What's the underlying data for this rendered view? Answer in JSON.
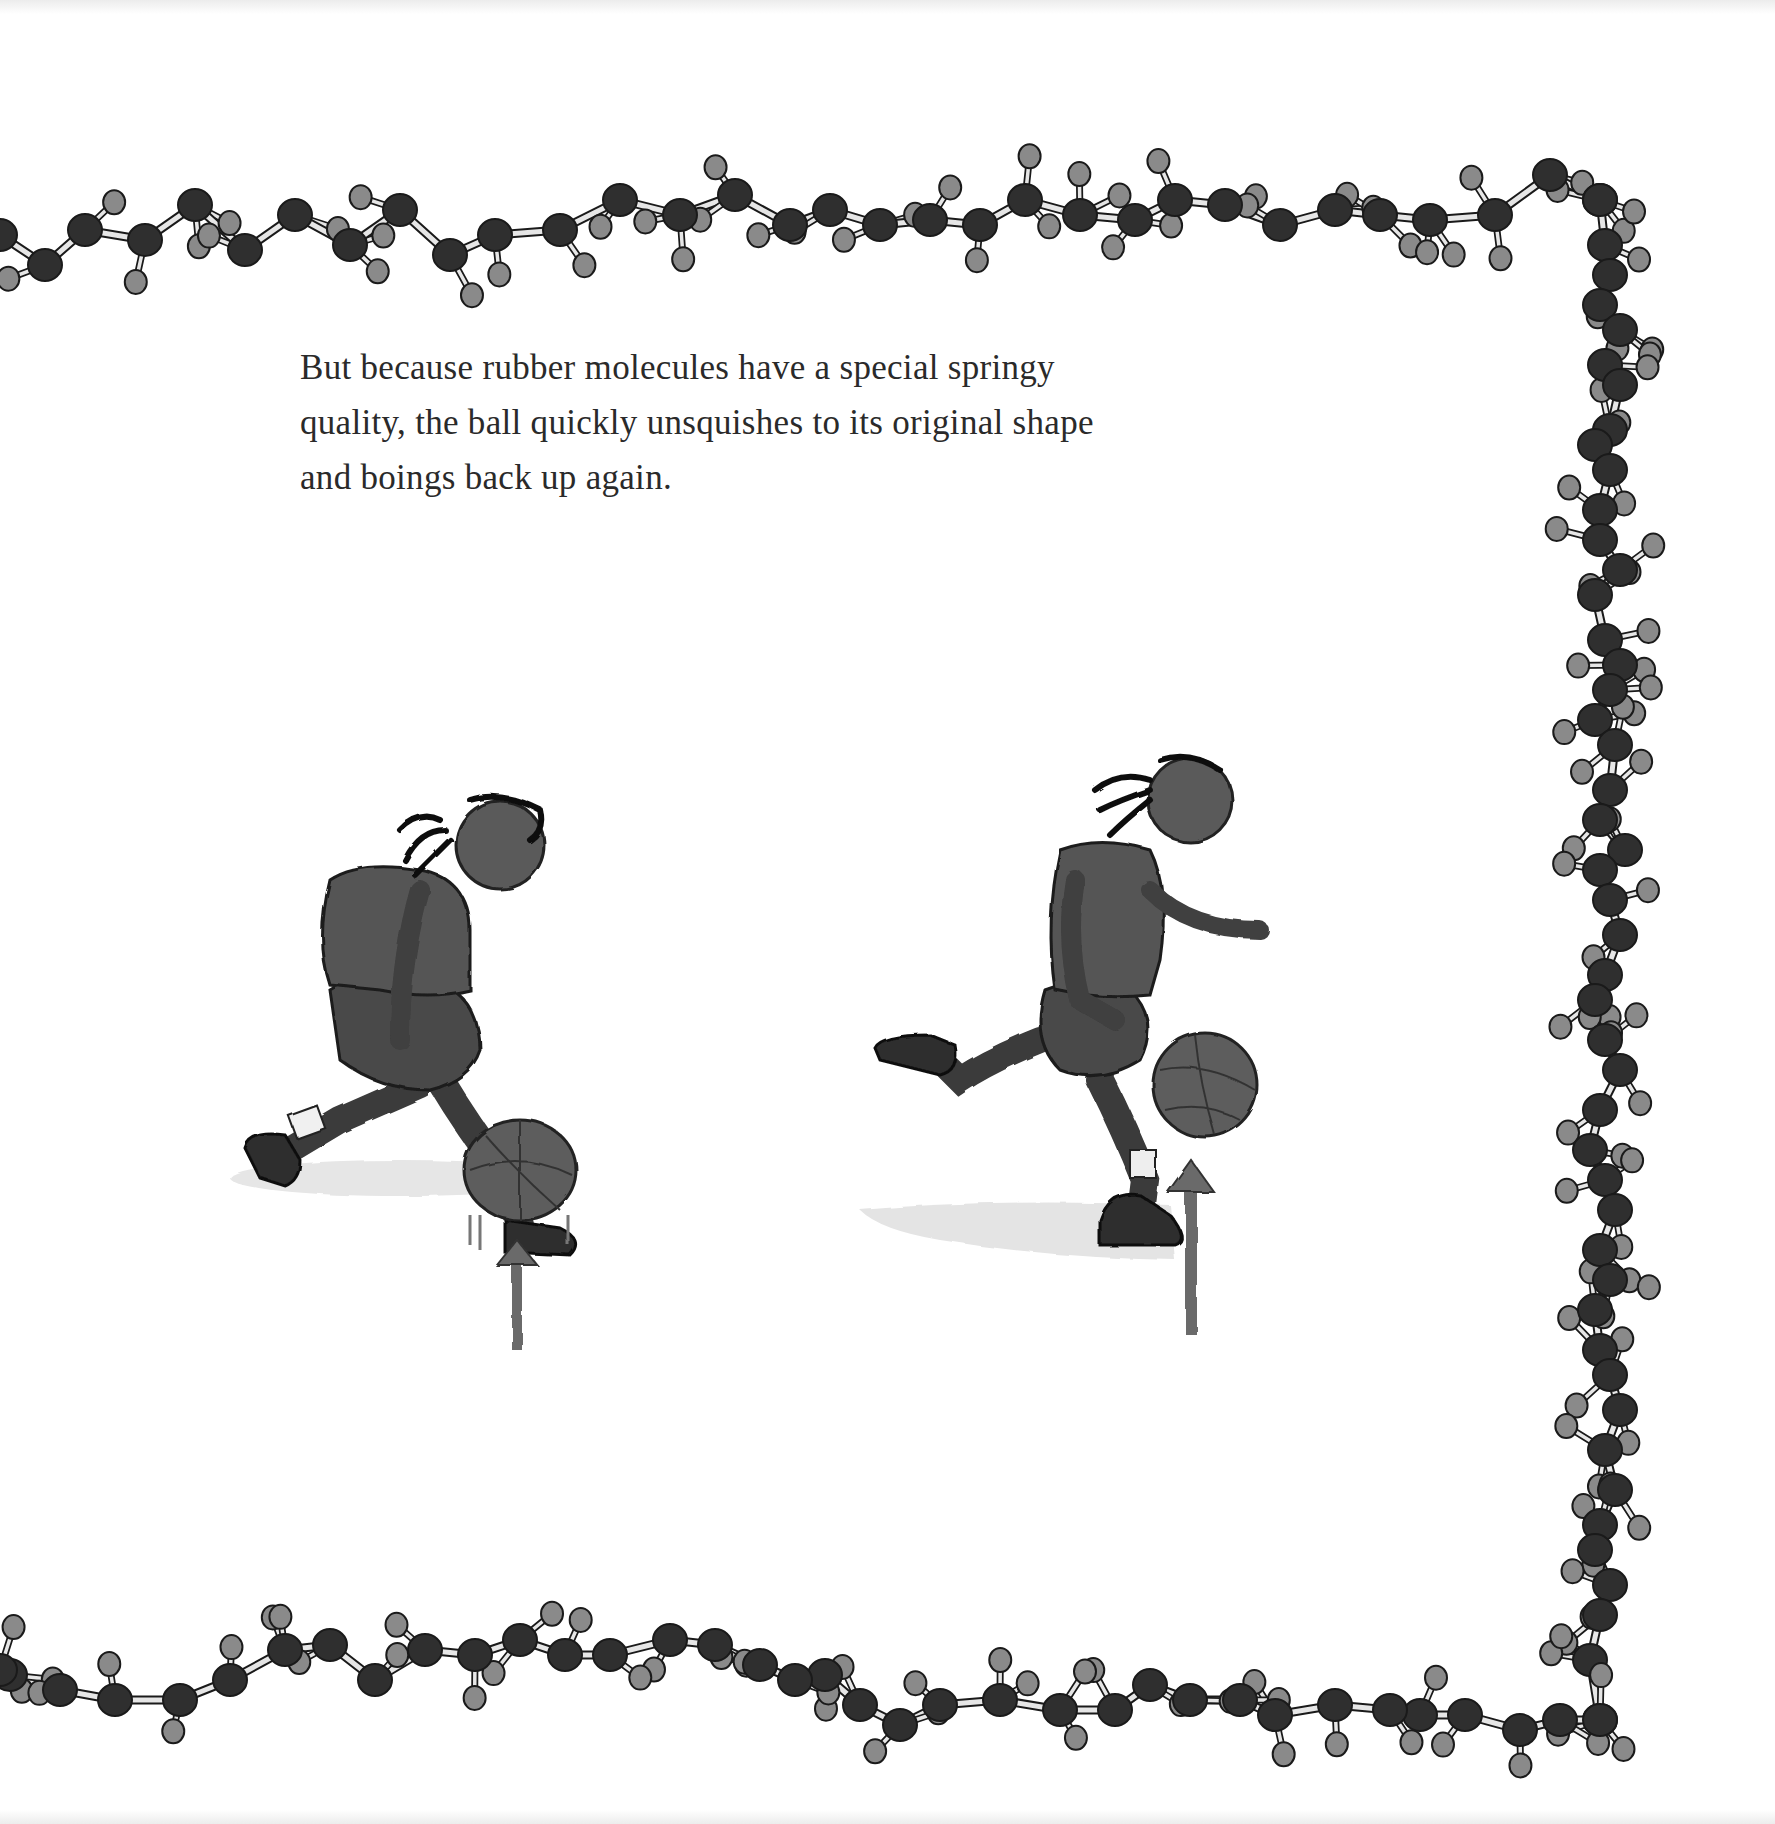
{
  "page": {
    "text_lines": [
      "But because rubber molecules have a special springy",
      "quality, the ball quickly unsquishes to its original shape",
      "and boings back up again."
    ]
  },
  "illustration": {
    "figures": [
      {
        "name": "girl-dribbling-ball-squished",
        "ball_state": "squished against floor",
        "arrow": "up"
      },
      {
        "name": "girl-running-ball-bouncing-up",
        "ball_state": "round, bouncing up",
        "arrow": "up"
      }
    ]
  },
  "border": {
    "description": "rubber (polyisoprene) molecule chain ball-and-stick border",
    "colors": {
      "carbon": "#2f2f2f",
      "hydrogen": "#8a8a8a",
      "bond": "#e6e6e6",
      "outline": "#1a1a1a"
    },
    "top_chain": [
      [
        0,
        235
      ],
      [
        45,
        265
      ],
      [
        85,
        230
      ],
      [
        145,
        240
      ],
      [
        195,
        205
      ],
      [
        245,
        250
      ],
      [
        295,
        215
      ],
      [
        350,
        245
      ],
      [
        400,
        210
      ],
      [
        450,
        255
      ],
      [
        495,
        235
      ],
      [
        560,
        230
      ],
      [
        620,
        200
      ],
      [
        680,
        215
      ],
      [
        735,
        195
      ],
      [
        790,
        225
      ],
      [
        830,
        210
      ],
      [
        880,
        225
      ],
      [
        930,
        220
      ],
      [
        980,
        225
      ],
      [
        1025,
        200
      ],
      [
        1080,
        215
      ],
      [
        1135,
        220
      ],
      [
        1175,
        200
      ],
      [
        1225,
        205
      ],
      [
        1280,
        225
      ],
      [
        1335,
        210
      ],
      [
        1380,
        215
      ],
      [
        1430,
        220
      ],
      [
        1495,
        215
      ],
      [
        1550,
        175
      ],
      [
        1600,
        200
      ]
    ],
    "right_chain": [
      [
        1600,
        200
      ],
      [
        1605,
        245
      ],
      [
        1610,
        275
      ],
      [
        1600,
        305
      ],
      [
        1620,
        330
      ],
      [
        1605,
        365
      ],
      [
        1620,
        385
      ],
      [
        1610,
        430
      ],
      [
        1595,
        445
      ],
      [
        1610,
        470
      ],
      [
        1600,
        510
      ],
      [
        1600,
        540
      ],
      [
        1620,
        570
      ],
      [
        1595,
        595
      ],
      [
        1605,
        640
      ],
      [
        1620,
        665
      ],
      [
        1610,
        690
      ],
      [
        1595,
        720
      ],
      [
        1615,
        745
      ],
      [
        1610,
        790
      ],
      [
        1600,
        820
      ],
      [
        1625,
        850
      ],
      [
        1600,
        870
      ],
      [
        1610,
        900
      ],
      [
        1620,
        935
      ],
      [
        1605,
        975
      ],
      [
        1595,
        1000
      ],
      [
        1605,
        1040
      ],
      [
        1620,
        1070
      ],
      [
        1600,
        1110
      ],
      [
        1590,
        1150
      ],
      [
        1605,
        1180
      ],
      [
        1615,
        1210
      ],
      [
        1600,
        1250
      ],
      [
        1610,
        1280
      ],
      [
        1595,
        1310
      ],
      [
        1600,
        1350
      ],
      [
        1610,
        1375
      ],
      [
        1620,
        1410
      ],
      [
        1605,
        1450
      ],
      [
        1615,
        1490
      ],
      [
        1600,
        1525
      ],
      [
        1595,
        1550
      ],
      [
        1610,
        1585
      ],
      [
        1600,
        1615
      ],
      [
        1590,
        1660
      ],
      [
        1600,
        1720
      ]
    ],
    "bottom_chain": [
      [
        1600,
        1720
      ],
      [
        1560,
        1720
      ],
      [
        1520,
        1730
      ],
      [
        1465,
        1715
      ],
      [
        1420,
        1715
      ],
      [
        1390,
        1710
      ],
      [
        1335,
        1705
      ],
      [
        1275,
        1715
      ],
      [
        1240,
        1700
      ],
      [
        1190,
        1700
      ],
      [
        1150,
        1685
      ],
      [
        1115,
        1710
      ],
      [
        1060,
        1710
      ],
      [
        1000,
        1700
      ],
      [
        940,
        1705
      ],
      [
        900,
        1725
      ],
      [
        860,
        1705
      ],
      [
        825,
        1675
      ],
      [
        795,
        1680
      ],
      [
        760,
        1665
      ],
      [
        715,
        1645
      ],
      [
        670,
        1640
      ],
      [
        610,
        1655
      ],
      [
        565,
        1655
      ],
      [
        520,
        1640
      ],
      [
        475,
        1655
      ],
      [
        425,
        1650
      ],
      [
        375,
        1680
      ],
      [
        330,
        1645
      ],
      [
        285,
        1650
      ],
      [
        230,
        1680
      ],
      [
        180,
        1700
      ],
      [
        115,
        1700
      ],
      [
        60,
        1690
      ],
      [
        10,
        1675
      ],
      [
        0,
        1670
      ]
    ]
  }
}
